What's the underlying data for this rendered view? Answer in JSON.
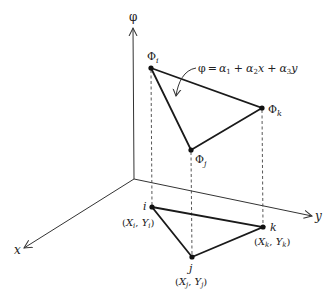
{
  "diagram": {
    "axes": {
      "vertical": "φ",
      "x": "x",
      "y": "y"
    },
    "equation": {
      "lhs": "φ",
      "equals": "=",
      "terms": [
        "α",
        "1",
        "+",
        "α",
        "2",
        "x",
        "+",
        "α",
        "3",
        "y"
      ],
      "text": "φ = α1 + α2x + α3y"
    },
    "upper_nodes": [
      {
        "id": "i",
        "symbol": "Φ",
        "sub": "i"
      },
      {
        "id": "j",
        "symbol": "Φ",
        "sub": "j"
      },
      {
        "id": "k",
        "symbol": "Φ",
        "sub": "k"
      }
    ],
    "lower_nodes": [
      {
        "id": "i",
        "label": "i",
        "coord": {
          "X": "X",
          "Xsub": "i",
          "Y": "Y",
          "Ysub": "i"
        }
      },
      {
        "id": "j",
        "label": "j",
        "coord": {
          "X": "X",
          "Xsub": "j",
          "Y": "Y",
          "Ysub": "j"
        }
      },
      {
        "id": "k",
        "label": "k",
        "coord": {
          "X": "X",
          "Xsub": "k",
          "Y": "Y",
          "Ysub": "k"
        }
      }
    ],
    "colors": {
      "line": "#1a1a1a",
      "background": "#ffffff"
    }
  }
}
